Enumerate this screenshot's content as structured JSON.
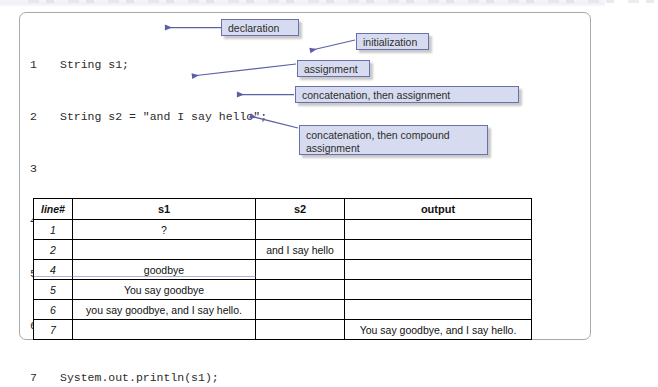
{
  "figure": {
    "accent_color": "#5b5fa8",
    "callout_fill": "#d7dbef",
    "callout_border": "#6a6fae",
    "table_border": "#000000"
  },
  "code": {
    "lines": [
      {
        "num": "1",
        "text": "String s1;"
      },
      {
        "num": "2",
        "text": "String s2 = \"and I say hello\";"
      },
      {
        "num": "3",
        "text": ""
      },
      {
        "num": "4",
        "text": "s1 = \"goodbye\";"
      },
      {
        "num": "5",
        "text": "s1 = \"You say \" + s1;"
      },
      {
        "num": "6",
        "text": "s1 += \", \" + s2 + '.';"
      },
      {
        "num": "7",
        "text": "System.out.println(s1);"
      }
    ]
  },
  "callouts": {
    "declaration": "declaration",
    "initialization": "initialization",
    "assignment": "assignment",
    "concat_assign": "concatenation, then assignment",
    "concat_compound": "concatenation, then compound assignment"
  },
  "table": {
    "headers": [
      "line#",
      "s1",
      "s2",
      "output"
    ],
    "rows": [
      {
        "line": "1",
        "s1": "?",
        "s2": "",
        "output": ""
      },
      {
        "line": "2",
        "s1": "",
        "s2": "and I say hello",
        "output": ""
      },
      {
        "line": "4",
        "s1": "goodbye",
        "s2": "",
        "output": ""
      },
      {
        "line": "5",
        "s1": "You say goodbye",
        "s2": "",
        "output": ""
      },
      {
        "line": "6",
        "s1": "you say goodbye, and I say hello.",
        "s2": "",
        "output": ""
      },
      {
        "line": "7",
        "s1": "",
        "s2": "",
        "output": "You say goodbye, and I say hello."
      }
    ]
  }
}
